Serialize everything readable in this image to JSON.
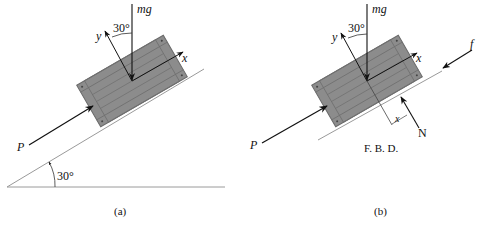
{
  "figure_a": {
    "caption": "(a)",
    "labels": {
      "weight": "mg",
      "angle_force": "30°",
      "y_axis": "y",
      "x_axis": "x",
      "push_force": "P",
      "incline_angle": "30°"
    }
  },
  "figure_b": {
    "caption": "(b)",
    "subtitle": "F. B. D.",
    "labels": {
      "weight": "mg",
      "angle_force": "30°",
      "y_axis": "y",
      "x_axis": "x",
      "push_force": "P",
      "friction": "f",
      "normal": "N",
      "offset": "x"
    }
  },
  "colors": {
    "crate_fill": "#8c8c8c",
    "crate_border": "#6f6f6f",
    "line": "#222222",
    "incline": "#9a9a9a"
  }
}
